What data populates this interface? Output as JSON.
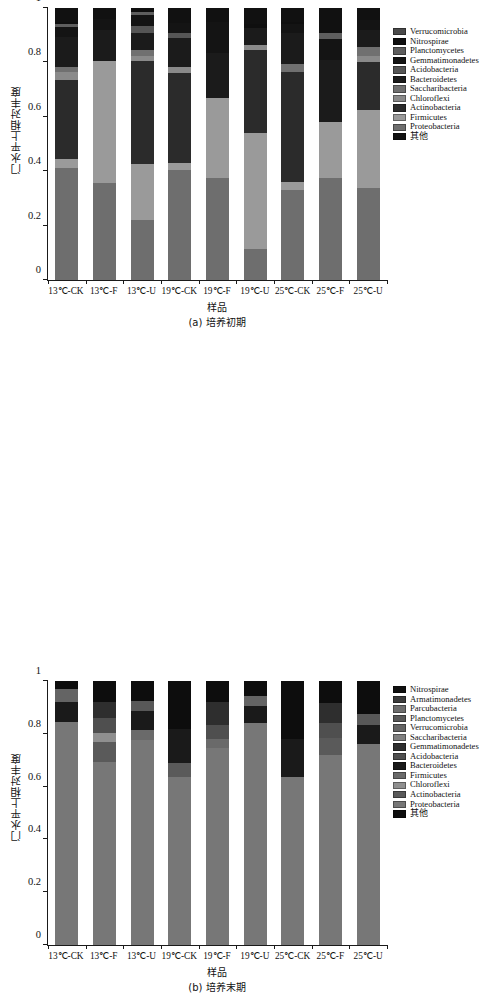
{
  "figure": {
    "y_axis_title": "门水平上相对丰度",
    "x_axis_title": "样品",
    "y_ticks": [
      "1",
      "0.8",
      "0.6",
      "0.4",
      "0.2",
      "0"
    ],
    "y_tick_values": [
      1,
      0.8,
      0.6,
      0.4,
      0.2,
      0
    ]
  },
  "chart_data": [
    {
      "type": "bar",
      "subtype": "stacked",
      "panel": "a",
      "caption": "(a) 培养初期",
      "title": "",
      "xlabel": "样品",
      "ylabel": "门水平上相对丰度",
      "ylim": [
        0,
        1
      ],
      "grid": false,
      "legend_position": "right",
      "categories": [
        "13℃-CK",
        "13℃-F",
        "13℃-U",
        "19℃-CK",
        "19℃-F",
        "19℃-U",
        "25℃-CK",
        "25℃-F",
        "25℃-U"
      ],
      "series": [
        {
          "name": "Proteobacteria",
          "color": "#6e6e6e",
          "values": [
            0.41,
            0.355,
            0.22,
            0.405,
            0.375,
            0.115,
            0.33,
            0.375,
            0.34
          ]
        },
        {
          "name": "Firmicutes",
          "color": "#9a9a9a",
          "values": [
            0.035,
            0.45,
            0.205,
            0.025,
            0.295,
            0.425,
            0.03,
            0.205,
            0.285
          ]
        },
        {
          "name": "Actinobacteria",
          "color": "#2b2b2b",
          "values": [
            0.29,
            0.0,
            0.38,
            0.33,
            0.0,
            0.305,
            0.405,
            0.0,
            0.175
          ]
        },
        {
          "name": "Chloroflexi",
          "color": "#8a8a8a",
          "values": [
            0.03,
            0.0,
            0.02,
            0.025,
            0.0,
            0.02,
            0.0,
            0.0,
            0.025
          ]
        },
        {
          "name": "Saccharibacteria",
          "color": "#707070",
          "values": [
            0.02,
            0.0,
            0.02,
            0.0,
            0.0,
            0.0,
            0.03,
            0.0,
            0.03
          ]
        },
        {
          "name": "Bacteroidetes",
          "color": "#1b1b1b",
          "values": [
            0.11,
            0.115,
            0.065,
            0.105,
            0.165,
            0.06,
            0.115,
            0.23,
            0.065
          ]
        },
        {
          "name": "Acidobacteria",
          "color": "#555555",
          "values": [
            0.0,
            0.0,
            0.025,
            0.02,
            0.0,
            0.0,
            0.0,
            0.0,
            0.0
          ]
        },
        {
          "name": "Gemmatimonadetes",
          "color": "#141414",
          "values": [
            0.035,
            0.04,
            0.04,
            0.035,
            0.115,
            0.0,
            0.03,
            0.075,
            0.035
          ]
        },
        {
          "name": "Planctomycetes",
          "color": "#5e5e5e",
          "values": [
            0.01,
            0.0,
            0.01,
            0.0,
            0.0,
            0.0,
            0.0,
            0.025,
            0.0
          ]
        },
        {
          "name": "Nitrospirae",
          "color": "#0f0f0f",
          "values": [
            0.01,
            0.0,
            0.01,
            0.0,
            0.0,
            0.015,
            0.01,
            0.0,
            0.0
          ]
        },
        {
          "name": "Verrucomicrobia",
          "color": "#4a4a4a",
          "values": [
            0.0,
            0.0,
            0.0,
            0.0,
            0.0,
            0.0,
            0.0,
            0.0,
            0.0
          ]
        },
        {
          "name": "其他",
          "color": "#111111",
          "values": [
            0.05,
            0.04,
            0.005,
            0.055,
            0.05,
            0.06,
            0.05,
            0.09,
            0.045
          ]
        }
      ],
      "legend_entries": [
        {
          "label": "Verrucomicrobia",
          "color": "#4a4a4a"
        },
        {
          "label": "Nitrospirae",
          "color": "#0f0f0f"
        },
        {
          "label": "Planctomycetes",
          "color": "#5e5e5e"
        },
        {
          "label": "Gemmatimonadetes",
          "color": "#141414"
        },
        {
          "label": "Acidobacteria",
          "color": "#555555"
        },
        {
          "label": "Bacteroidetes",
          "color": "#1b1b1b"
        },
        {
          "label": "Saccharibacteria",
          "color": "#707070"
        },
        {
          "label": "Chloroflexi",
          "color": "#8a8a8a"
        },
        {
          "label": "Actinobacteria",
          "color": "#2b2b2b"
        },
        {
          "label": "Firmicutes",
          "color": "#9a9a9a"
        },
        {
          "label": "Proteobacteria",
          "color": "#6e6e6e"
        },
        {
          "label": "其他",
          "color": "#111111"
        }
      ]
    },
    {
      "type": "bar",
      "subtype": "stacked",
      "panel": "b",
      "caption": "(b) 培养末期",
      "title": "",
      "xlabel": "样品",
      "ylabel": "门水平上相对丰度",
      "ylim": [
        0,
        1
      ],
      "grid": false,
      "legend_position": "right",
      "categories": [
        "13℃-CK",
        "13℃-F",
        "13℃-U",
        "19℃-CK",
        "19℃-F",
        "19℃-U",
        "25℃-CK",
        "25℃-F",
        "25℃-U"
      ],
      "series": [
        {
          "name": "Proteobacteria",
          "color": "#777777",
          "values": [
            0.845,
            0.695,
            0.775,
            0.635,
            0.745,
            0.84,
            0.635,
            0.72,
            0.76
          ]
        },
        {
          "name": "Actinobacteria",
          "color": "#5a5a5a",
          "values": [
            0.0,
            0.075,
            0.0,
            0.055,
            0.0,
            0.0,
            0.0,
            0.065,
            0.0
          ]
        },
        {
          "name": "Chloroflexi",
          "color": "#8f8f8f",
          "values": [
            0.0,
            0.035,
            0.0,
            0.0,
            0.0,
            0.0,
            0.0,
            0.0,
            0.0
          ]
        },
        {
          "name": "Firmicutes",
          "color": "#6a6a6a",
          "values": [
            0.0,
            0.0,
            0.04,
            0.0,
            0.035,
            0.0,
            0.0,
            0.0,
            0.0
          ]
        },
        {
          "name": "Bacteroidetes",
          "color": "#1a1a1a",
          "values": [
            0.075,
            0.0,
            0.07,
            0.13,
            0.0,
            0.065,
            0.145,
            0.0,
            0.075
          ]
        },
        {
          "name": "Acidobacteria",
          "color": "#4f4f4f",
          "values": [
            0.0,
            0.055,
            0.0,
            0.0,
            0.055,
            0.0,
            0.0,
            0.055,
            0.0
          ]
        },
        {
          "name": "Gemmatimonadetes",
          "color": "#2e2e2e",
          "values": [
            0.0,
            0.06,
            0.0,
            0.0,
            0.085,
            0.0,
            0.0,
            0.075,
            0.0
          ]
        },
        {
          "name": "Saccharibacteria",
          "color": "#808080",
          "values": [
            0.0,
            0.0,
            0.0,
            0.0,
            0.0,
            0.0,
            0.0,
            0.0,
            0.0
          ]
        },
        {
          "name": "Verrucomicrobia",
          "color": "#646464",
          "values": [
            0.05,
            0.0,
            0.0,
            0.0,
            0.0,
            0.04,
            0.0,
            0.0,
            0.0
          ]
        },
        {
          "name": "Planctomycetes",
          "color": "#585858",
          "values": [
            0.0,
            0.0,
            0.04,
            0.0,
            0.0,
            0.0,
            0.0,
            0.0,
            0.04
          ]
        },
        {
          "name": "Parcubacteria",
          "color": "#6d6d6d",
          "values": [
            0.0,
            0.0,
            0.0,
            0.0,
            0.0,
            0.0,
            0.0,
            0.0,
            0.0
          ]
        },
        {
          "name": "Armatimonadetes",
          "color": "#3c3c3c",
          "values": [
            0.0,
            0.0,
            0.0,
            0.0,
            0.0,
            0.0,
            0.0,
            0.0,
            0.0
          ]
        },
        {
          "name": "Nitrospirae",
          "color": "#101010",
          "values": [
            0.0,
            0.0,
            0.0,
            0.0,
            0.0,
            0.0,
            0.0,
            0.0,
            0.0
          ]
        },
        {
          "name": "其他",
          "color": "#0d0d0d",
          "values": [
            0.03,
            0.08,
            0.075,
            0.18,
            0.08,
            0.055,
            0.22,
            0.085,
            0.125
          ]
        }
      ],
      "legend_entries": [
        {
          "label": "Nitrospirae",
          "color": "#101010"
        },
        {
          "label": "Armatimonadetes",
          "color": "#3c3c3c"
        },
        {
          "label": "Parcubacteria",
          "color": "#6d6d6d"
        },
        {
          "label": "Planctomycetes",
          "color": "#585858"
        },
        {
          "label": "Verrucomicrobia",
          "color": "#646464"
        },
        {
          "label": "Saccharibacteria",
          "color": "#808080"
        },
        {
          "label": "Gemmatimonadetes",
          "color": "#2e2e2e"
        },
        {
          "label": "Acidobacteria",
          "color": "#4f4f4f"
        },
        {
          "label": "Bacteroidetes",
          "color": "#1a1a1a"
        },
        {
          "label": "Firmicutes",
          "color": "#6a6a6a"
        },
        {
          "label": "Chloroflexi",
          "color": "#8f8f8f"
        },
        {
          "label": "Actinobacteria",
          "color": "#5a5a5a"
        },
        {
          "label": "Proteobacteria",
          "color": "#777777"
        },
        {
          "label": "其他",
          "color": "#0d0d0d"
        }
      ]
    }
  ]
}
